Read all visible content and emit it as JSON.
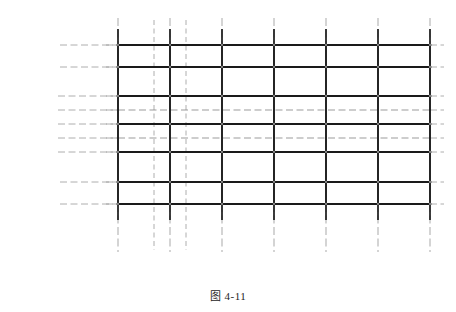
{
  "figure": {
    "caption": "图 4-11",
    "background": "#ffffff",
    "ink": "#2b2b2b",
    "beam_color": "#1a1a1a",
    "light_color": "#8a8a8a",
    "dash_color": "#9a9a9a"
  },
  "axes": {
    "vertical_labels": [
      "1",
      "2",
      "3",
      "4",
      "5",
      "6",
      "7"
    ],
    "horizontal_labels": [
      "D",
      "C",
      "B",
      "A"
    ]
  },
  "dimensions": {
    "horizontal": [
      {
        "label": "1 000 mm"
      },
      {
        "label": "1 000 mm"
      }
    ],
    "vertical": [
      {
        "label": "1 000 mm"
      },
      {
        "label": "1 000 mm"
      }
    ]
  },
  "chart_data": {
    "type": "diagram",
    "title": "图 4-11",
    "grid_x": [
      {
        "label": "1",
        "x": 118
      },
      {
        "label": "2",
        "x": 170
      },
      {
        "label": "3",
        "x": 222
      },
      {
        "label": "4",
        "x": 274
      },
      {
        "label": "5",
        "x": 326
      },
      {
        "label": "6",
        "x": 378
      },
      {
        "label": "7",
        "x": 430
      }
    ],
    "aux_x": [
      154,
      186
    ],
    "grid_y": [
      {
        "label": "D",
        "y": 45,
        "weight": "heavy"
      },
      {
        "label": "C",
        "y": 67,
        "weight": "heavy"
      },
      {
        "label": "",
        "y": 96,
        "weight": "heavy"
      },
      {
        "label": "",
        "y": 110,
        "weight": "light"
      },
      {
        "label": "",
        "y": 124,
        "weight": "heavy"
      },
      {
        "label": "",
        "y": 138,
        "weight": "light"
      },
      {
        "label": "",
        "y": 152,
        "weight": "heavy"
      },
      {
        "label": "B",
        "y": 182,
        "weight": "heavy"
      },
      {
        "label": "A",
        "y": 204,
        "weight": "heavy"
      }
    ]
  }
}
